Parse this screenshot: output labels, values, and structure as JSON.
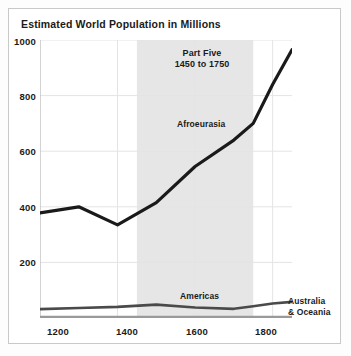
{
  "figure": {
    "title": "Estimated World Population in Millions",
    "border_color": "#c9c9c9",
    "background": "#ffffff"
  },
  "annotations": {
    "band_line1": "Part Five",
    "band_line2": "1450 to 1750",
    "afroeurasia_label": "Afroeurasia",
    "americas_label": "Americas",
    "australia_line1": "Australia",
    "australia_line2": "& Oceania"
  },
  "chart_data": {
    "type": "line",
    "title": "Estimated World Population in Millions",
    "xlabel": "",
    "ylabel": "",
    "xlim": [
      1200,
      1850
    ],
    "ylim": [
      0,
      1000
    ],
    "xticks": [
      1200,
      1400,
      1600,
      1800
    ],
    "xtick_labels": [
      "1200",
      "1400",
      "1600",
      "1800"
    ],
    "yticks": [
      200,
      400,
      600,
      800,
      1000
    ],
    "ytick_labels": [
      "200",
      "400",
      "600",
      "800",
      "1000"
    ],
    "grid": true,
    "grid_color": "#e4e4e4",
    "legend": "inline-annotations",
    "shaded_band": {
      "label": "Part Five",
      "sublabel": "1450 to 1750",
      "x_start": 1450,
      "x_end": 1750,
      "color": "#e6e6e6"
    },
    "x": [
      1200,
      1300,
      1400,
      1500,
      1600,
      1700,
      1750,
      1800,
      1850
    ],
    "series": [
      {
        "name": "Afroeurasia",
        "color": "#1a1a1a",
        "width": 3.2,
        "values": [
          378,
          400,
          335,
          415,
          545,
          640,
          700,
          840,
          965
        ]
      },
      {
        "name": "Americas",
        "color": "#4a4a4a",
        "width": 2.6,
        "values": [
          32,
          36,
          40,
          48,
          38,
          33,
          42,
          52,
          58
        ]
      },
      {
        "name": "Australia & Oceania",
        "color": "#9a9a9a",
        "width": 2.6,
        "values": [
          3,
          3,
          3,
          3,
          3,
          3,
          3,
          3,
          3
        ]
      }
    ]
  }
}
